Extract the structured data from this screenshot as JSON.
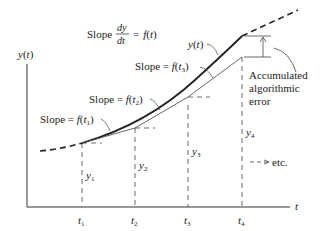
{
  "diagram": {
    "type": "euler-method-illustration",
    "axes": {
      "y_label": "y(t)",
      "x_label": "t"
    },
    "time_ticks": [
      "t1",
      "t2",
      "t3",
      "t4"
    ],
    "step_labels": [
      "y1",
      "y2",
      "y3",
      "y4"
    ],
    "curve_label": "y(t)",
    "slope_equation": {
      "prefix": "Slope",
      "numerator": "dy",
      "denominator": "dt",
      "rhs": "= f(t)"
    },
    "slope_labels": [
      "Slope = f(t1)",
      "Slope = f(t2)",
      "Slope = f(t3)"
    ],
    "error_annotation": {
      "line1": "Accumulated",
      "line2": "algorithmic",
      "line3": "error"
    },
    "etc_label": "etc.",
    "colors": {
      "true_curve": "#222222",
      "approximation": "#555555",
      "guides": "#444444",
      "background": "#ffffff"
    }
  }
}
